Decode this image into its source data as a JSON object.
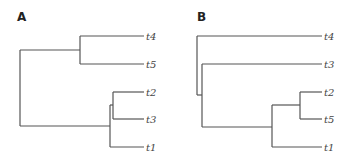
{
  "figure": {
    "panels": [
      {
        "label": "A",
        "tree": "((t4,t5),((t2,t3),t1))",
        "leaves": [
          "t4",
          "t5",
          "t2",
          "t3",
          "t1"
        ]
      },
      {
        "label": "B",
        "tree": "(t4,(t3,((t2,t5),t1)))",
        "leaves": [
          "t4",
          "t3",
          "t2",
          "t5",
          "t1"
        ]
      }
    ],
    "line_color": "#555555"
  }
}
